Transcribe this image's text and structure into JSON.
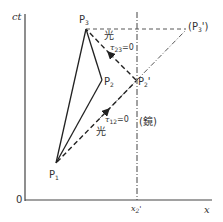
{
  "diagram": {
    "type": "spacetime-diagram",
    "axes": {
      "y_label": "ct",
      "x_label": "x",
      "origin_label": "0",
      "x_tick_label": "x2'"
    },
    "points": [
      {
        "id": "P1",
        "label": "P",
        "sub": "1",
        "x": 56,
        "y": 163
      },
      {
        "id": "P2",
        "label": "P",
        "sub": "2",
        "x": 102,
        "y": 80
      },
      {
        "id": "P3",
        "label": "P",
        "sub": "3",
        "x": 86,
        "y": 29
      },
      {
        "id": "P2p",
        "label": "P",
        "sub": "2",
        "prime": "'",
        "x": 136,
        "y": 80
      },
      {
        "id": "P3p",
        "label": "(P",
        "sub": "3",
        "prime": "')",
        "x": 187,
        "y": 29
      }
    ],
    "annotations": {
      "light_upper": "光",
      "light_lower": "光",
      "tau23": "τ",
      "tau23_sub": "23",
      "tau23_eq": "=0",
      "tau12": "τ",
      "tau12_sub": "12",
      "tau12_eq": "=0",
      "mirror": "(鏡)"
    },
    "colors": {
      "line": "#333333",
      "background": "#ffffff"
    }
  }
}
